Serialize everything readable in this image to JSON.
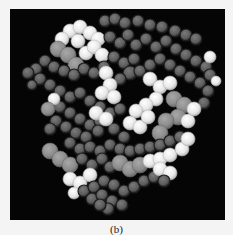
{
  "figure": {
    "caption": "(b)",
    "panel_background": "#050505",
    "shades": {
      "dark": {
        "fill": "#5a5a5a",
        "stroke": "#1e1e1e",
        "highlight": "#7a7a7a"
      },
      "mid": {
        "fill": "#8c8c8c",
        "stroke": "#6a6a6a",
        "highlight": "#a8a8a8"
      },
      "light": {
        "fill": "#e6e6e6",
        "stroke": "#b8b8b8",
        "highlight": "#ffffff"
      }
    },
    "atoms": [
      [
        95,
        12,
        6,
        "dark"
      ],
      [
        105,
        10,
        6,
        "dark"
      ],
      [
        115,
        14,
        6,
        "dark"
      ],
      [
        128,
        12,
        6,
        "dark"
      ],
      [
        140,
        16,
        6,
        "dark"
      ],
      [
        152,
        18,
        6,
        "dark"
      ],
      [
        165,
        22,
        6,
        "dark"
      ],
      [
        176,
        26,
        6,
        "dark"
      ],
      [
        186,
        30,
        6,
        "dark"
      ],
      [
        60,
        22,
        7,
        "light"
      ],
      [
        70,
        18,
        7,
        "light"
      ],
      [
        80,
        24,
        7,
        "light"
      ],
      [
        68,
        32,
        7,
        "light"
      ],
      [
        88,
        30,
        7,
        "light"
      ],
      [
        52,
        30,
        7,
        "light"
      ],
      [
        48,
        40,
        8,
        "mid"
      ],
      [
        58,
        46,
        8,
        "mid"
      ],
      [
        66,
        56,
        8,
        "mid"
      ],
      [
        76,
        44,
        7,
        "light"
      ],
      [
        84,
        38,
        7,
        "light"
      ],
      [
        92,
        46,
        7,
        "light"
      ],
      [
        35,
        52,
        6,
        "dark"
      ],
      [
        26,
        60,
        6,
        "dark"
      ],
      [
        18,
        64,
        6,
        "dark"
      ],
      [
        44,
        58,
        6,
        "dark"
      ],
      [
        54,
        62,
        6,
        "dark"
      ],
      [
        64,
        66,
        6,
        "dark"
      ],
      [
        74,
        60,
        6,
        "dark"
      ],
      [
        84,
        64,
        6,
        "dark"
      ],
      [
        94,
        58,
        6,
        "dark"
      ],
      [
        100,
        28,
        6,
        "dark"
      ],
      [
        110,
        34,
        6,
        "dark"
      ],
      [
        118,
        26,
        6,
        "dark"
      ],
      [
        126,
        36,
        6,
        "dark"
      ],
      [
        136,
        30,
        6,
        "dark"
      ],
      [
        146,
        38,
        6,
        "dark"
      ],
      [
        156,
        32,
        6,
        "dark"
      ],
      [
        166,
        40,
        6,
        "dark"
      ],
      [
        176,
        46,
        6,
        "dark"
      ],
      [
        186,
        52,
        6,
        "dark"
      ],
      [
        196,
        58,
        6,
        "dark"
      ],
      [
        200,
        48,
        6,
        "light"
      ],
      [
        104,
        48,
        6,
        "dark"
      ],
      [
        114,
        54,
        6,
        "dark"
      ],
      [
        124,
        50,
        6,
        "dark"
      ],
      [
        120,
        64,
        7,
        "dark"
      ],
      [
        110,
        70,
        6,
        "dark"
      ],
      [
        130,
        62,
        6,
        "dark"
      ],
      [
        140,
        56,
        6,
        "dark"
      ],
      [
        150,
        50,
        6,
        "dark"
      ],
      [
        160,
        56,
        6,
        "dark"
      ],
      [
        170,
        62,
        6,
        "dark"
      ],
      [
        180,
        68,
        6,
        "dark"
      ],
      [
        190,
        74,
        6,
        "dark"
      ],
      [
        198,
        82,
        6,
        "dark"
      ],
      [
        194,
        94,
        6,
        "dark"
      ],
      [
        96,
        64,
        7,
        "light"
      ],
      [
        100,
        76,
        7,
        "light"
      ],
      [
        92,
        84,
        7,
        "light"
      ],
      [
        104,
        88,
        7,
        "light"
      ],
      [
        140,
        70,
        7,
        "light"
      ],
      [
        150,
        78,
        7,
        "light"
      ],
      [
        160,
        74,
        7,
        "light"
      ],
      [
        146,
        90,
        7,
        "light"
      ],
      [
        136,
        96,
        7,
        "light"
      ],
      [
        126,
        102,
        7,
        "light"
      ],
      [
        120,
        114,
        7,
        "light"
      ],
      [
        130,
        118,
        7,
        "light"
      ],
      [
        138,
        108,
        7,
        "light"
      ],
      [
        164,
        90,
        8,
        "mid"
      ],
      [
        174,
        96,
        8,
        "mid"
      ],
      [
        168,
        108,
        8,
        "mid"
      ],
      [
        156,
        112,
        8,
        "mid"
      ],
      [
        150,
        124,
        8,
        "mid"
      ],
      [
        178,
        112,
        7,
        "light"
      ],
      [
        184,
        100,
        7,
        "light"
      ],
      [
        40,
        76,
        6,
        "dark"
      ],
      [
        50,
        82,
        6,
        "dark"
      ],
      [
        60,
        88,
        6,
        "dark"
      ],
      [
        70,
        84,
        6,
        "dark"
      ],
      [
        80,
        92,
        6,
        "dark"
      ],
      [
        90,
        98,
        6,
        "dark"
      ],
      [
        100,
        104,
        6,
        "dark"
      ],
      [
        110,
        100,
        6,
        "dark"
      ],
      [
        50,
        98,
        6,
        "dark"
      ],
      [
        60,
        104,
        6,
        "dark"
      ],
      [
        70,
        110,
        6,
        "dark"
      ],
      [
        80,
        116,
        6,
        "dark"
      ],
      [
        90,
        112,
        6,
        "dark"
      ],
      [
        104,
        120,
        6,
        "dark"
      ],
      [
        114,
        128,
        6,
        "dark"
      ],
      [
        44,
        90,
        6,
        "light"
      ],
      [
        38,
        100,
        7,
        "mid"
      ],
      [
        46,
        112,
        6,
        "dark"
      ],
      [
        56,
        118,
        6,
        "dark"
      ],
      [
        40,
        120,
        6,
        "dark"
      ],
      [
        66,
        124,
        6,
        "dark"
      ],
      [
        76,
        128,
        6,
        "dark"
      ],
      [
        86,
        104,
        7,
        "light"
      ],
      [
        96,
        110,
        7,
        "light"
      ],
      [
        88,
        122,
        6,
        "dark"
      ],
      [
        60,
        134,
        6,
        "dark"
      ],
      [
        70,
        140,
        6,
        "dark"
      ],
      [
        80,
        138,
        6,
        "dark"
      ],
      [
        90,
        142,
        6,
        "dark"
      ],
      [
        100,
        136,
        6,
        "dark"
      ],
      [
        110,
        140,
        6,
        "dark"
      ],
      [
        120,
        142,
        6,
        "dark"
      ],
      [
        130,
        140,
        6,
        "dark"
      ],
      [
        140,
        138,
        6,
        "dark"
      ],
      [
        150,
        136,
        6,
        "dark"
      ],
      [
        160,
        132,
        6,
        "dark"
      ],
      [
        170,
        128,
        6,
        "dark"
      ],
      [
        40,
        142,
        8,
        "mid"
      ],
      [
        50,
        150,
        8,
        "mid"
      ],
      [
        60,
        156,
        8,
        "mid"
      ],
      [
        72,
        150,
        6,
        "dark"
      ],
      [
        82,
        156,
        6,
        "dark"
      ],
      [
        92,
        150,
        6,
        "dark"
      ],
      [
        100,
        158,
        6,
        "dark"
      ],
      [
        110,
        154,
        8,
        "mid"
      ],
      [
        120,
        160,
        8,
        "mid"
      ],
      [
        130,
        156,
        8,
        "mid"
      ],
      [
        140,
        152,
        7,
        "light"
      ],
      [
        150,
        150,
        7,
        "light"
      ],
      [
        160,
        146,
        7,
        "light"
      ],
      [
        172,
        140,
        7,
        "light"
      ],
      [
        178,
        130,
        7,
        "light"
      ],
      [
        60,
        170,
        7,
        "light"
      ],
      [
        70,
        174,
        7,
        "light"
      ],
      [
        80,
        166,
        7,
        "light"
      ],
      [
        64,
        184,
        6,
        "light"
      ],
      [
        74,
        182,
        6,
        "dark"
      ],
      [
        84,
        178,
        6,
        "dark"
      ],
      [
        94,
        172,
        6,
        "dark"
      ],
      [
        104,
        176,
        6,
        "dark"
      ],
      [
        114,
        182,
        6,
        "dark"
      ],
      [
        124,
        178,
        6,
        "dark"
      ],
      [
        134,
        172,
        6,
        "dark"
      ],
      [
        144,
        168,
        6,
        "dark"
      ],
      [
        82,
        190,
        6,
        "dark"
      ],
      [
        92,
        186,
        6,
        "dark"
      ],
      [
        102,
        192,
        6,
        "dark"
      ],
      [
        98,
        200,
        6,
        "dark"
      ],
      [
        112,
        196,
        6,
        "dark"
      ],
      [
        90,
        196,
        6,
        "dark"
      ],
      [
        150,
        160,
        7,
        "light"
      ],
      [
        160,
        164,
        7,
        "light"
      ],
      [
        154,
        172,
        6,
        "dark"
      ],
      [
        30,
        70,
        6,
        "dark"
      ],
      [
        22,
        76,
        5,
        "dark"
      ],
      [
        200,
        66,
        6,
        "dark"
      ],
      [
        206,
        72,
        5,
        "light"
      ]
    ]
  }
}
